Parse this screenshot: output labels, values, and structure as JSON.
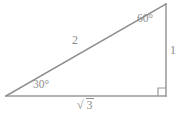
{
  "figure": {
    "kind": "geometry-diagram",
    "background_color": "#ffffff",
    "stroke_color": "#8c8c8c",
    "text_color": "#8c8c8c",
    "width": 180,
    "height": 114
  },
  "geometry": {
    "vertices": {
      "left": {
        "x": 6,
        "y": 96
      },
      "bottom_right": {
        "x": 166,
        "y": 96
      },
      "top_right": {
        "x": 166,
        "y": 4
      }
    },
    "right_angle_marker": {
      "at_vertex": "bottom_right",
      "size": 8,
      "present": true
    }
  },
  "angles": {
    "bottom_left": {
      "value": "30",
      "degree_symbol": "°",
      "label": "30°"
    },
    "top_right": {
      "value": "60",
      "degree_symbol": "°",
      "label": "60°"
    },
    "bottom_right": {
      "value": "90",
      "label": "right angle",
      "shown_as": "square-marker"
    }
  },
  "sides": {
    "hypotenuse": {
      "label": "2",
      "position": "above-left-of-diagonal"
    },
    "vertical": {
      "label": "1",
      "position": "right-of-vertical-edge"
    },
    "base": {
      "radical_sign": "√",
      "radicand": "3",
      "label": "√3",
      "position": "below-base"
    }
  }
}
